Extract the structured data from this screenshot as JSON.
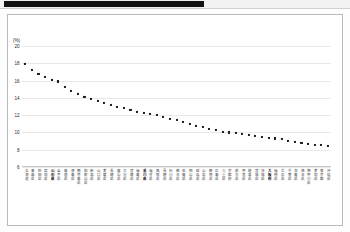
{
  "header": {
    "bar_color": "#131313",
    "band_color": "#f2f2f2"
  },
  "chart_data": {
    "type": "scatter",
    "title": "",
    "subtitle": "",
    "xlabel": "",
    "ylabel": "(%)",
    "unit_label": "(%)",
    "ylim": [
      6,
      20
    ],
    "yticks": [
      20,
      18,
      16,
      14,
      12,
      10,
      8,
      6
    ],
    "ytick_labels": [
      "20",
      "18",
      "16",
      "14",
      "12",
      "10",
      "8",
      "6"
    ],
    "grid": true,
    "grid_axis": "y",
    "legend": false,
    "legend_position": "none",
    "marker": "square",
    "marker_color": "#1b1b1b",
    "categories": [
      "北海道",
      "青森県",
      "秋田県",
      "高知県",
      "山形県",
      "岩手県",
      "島根県",
      "徳島県",
      "鹿児島県",
      "和歌山県",
      "新潟県",
      "山口県",
      "愛媛県",
      "長崎県",
      "富山県",
      "大分県",
      "宮崎県",
      "福島県",
      "香川県",
      "福井県",
      "鳥取県",
      "長野県",
      "石川県",
      "熊本県",
      "佐賀県",
      "岡山県",
      "群馬県",
      "山梨県",
      "静岡県",
      "広島県",
      "三重県",
      "京都府",
      "栃木県",
      "奈良県",
      "岐阜県",
      "宮城県",
      "茨城県",
      "大阪府",
      "福岡県",
      "兵庫県",
      "千葉県",
      "滋賀県",
      "埼玉県",
      "神奈川県",
      "愛知県",
      "東京都",
      "沖縄県"
    ],
    "values": [
      17.9,
      17.2,
      16.8,
      16.4,
      16.1,
      15.9,
      15.3,
      14.8,
      14.4,
      14.1,
      13.9,
      13.6,
      13.4,
      13.2,
      13.0,
      12.8,
      12.6,
      12.4,
      12.3,
      12.1,
      12.0,
      11.8,
      11.6,
      11.4,
      11.2,
      11.0,
      10.8,
      10.6,
      10.4,
      10.3,
      10.1,
      10.0,
      9.9,
      9.8,
      9.7,
      9.6,
      9.5,
      9.4,
      9.3,
      9.2,
      9.0,
      8.9,
      8.8,
      8.7,
      8.6,
      8.5,
      8.4
    ],
    "highlighted_categories": [
      "山形県",
      "香川県",
      "大阪府"
    ]
  }
}
